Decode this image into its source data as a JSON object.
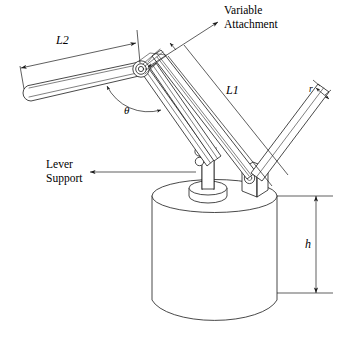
{
  "figure": {
    "background_color": "#ffffff",
    "line_color": "#1a1a1a",
    "width": 339,
    "height": 347
  },
  "labels": {
    "l2": "L2",
    "l1": "L1",
    "theta": "θ",
    "r": "r",
    "h": "h",
    "variable_attachment_line1": "Variable",
    "variable_attachment_line2": "Attachment",
    "lever_support_line1": "Lever",
    "lever_support_line2": "Support"
  },
  "annotations": [
    {
      "name": "l2-dimension",
      "label": "L2",
      "kind": "linear-dimension",
      "description": "Overall length of the counterweight lever arm, measured parallel to the arm with arrowheads at both ends"
    },
    {
      "name": "l1-dimension",
      "label": "L1",
      "kind": "linear-dimension",
      "description": "Overall length of the main diagonal arm, measured with an arrowhead at the upper end"
    },
    {
      "name": "theta-angle",
      "label": "θ",
      "kind": "angular-dimension",
      "description": "Included angle between the lever arm and the main diagonal arm at the pivot joint"
    },
    {
      "name": "r-dimension",
      "label": "r",
      "kind": "linear-dimension",
      "description": "Width (radius dimension) across the upper diagonal member"
    },
    {
      "name": "h-dimension",
      "label": "h",
      "kind": "linear-dimension",
      "description": "Height of the cylindrical base, measured vertically at the right side with arrowheads at both ends"
    },
    {
      "name": "variable-attachment-callout",
      "label": "Variable Attachment",
      "kind": "leader-callout",
      "description": "Leader line pointing from the text to the pivot cluster at the top of the mechanism"
    },
    {
      "name": "lever-support-callout",
      "label": "Lever Support",
      "kind": "leader-callout",
      "description": "Leader line pointing from the text to the pedestal mounted on the cylinder top"
    }
  ],
  "parts": [
    {
      "name": "lever-arm",
      "description": "Long slender bar with rounded left end, sloping up to the right toward the pivot"
    },
    {
      "name": "pivot-joint",
      "description": "Concentric circular hub cluster where the lever arm meets the diagonal arms"
    },
    {
      "name": "main-diagonal-arm",
      "description": "Long parallel-sided arm running down-left from the pivot to the pedestal"
    },
    {
      "name": "upper-diagonal-member",
      "description": "Parallel-sided member running down-right from the pivot to the attachment block"
    },
    {
      "name": "lever-support-pedestal",
      "description": "Vertical post on a round disc base standing on the cylinder top"
    },
    {
      "name": "attachment-block",
      "description": "Small rectangular block with a circular bore mounted on the cylinder top at the right"
    },
    {
      "name": "cylinder-base",
      "description": "Large vertical cylinder forming the foundation of the assembly"
    }
  ]
}
